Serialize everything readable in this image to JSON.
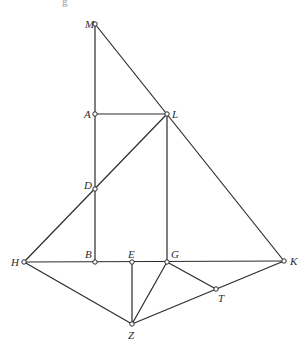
{
  "figure": {
    "type": "geometric-construction",
    "top_fragment": "g",
    "stroke_color": "#2b2b2b",
    "background": "#ffffff"
  },
  "points": [
    {
      "id": "M",
      "label": "M",
      "x": 95,
      "y": 24,
      "lx": 85,
      "ly": 28
    },
    {
      "id": "A",
      "label": "A",
      "x": 95,
      "y": 114,
      "lx": 84,
      "ly": 118
    },
    {
      "id": "L",
      "label": "L",
      "x": 167,
      "y": 114,
      "lx": 172,
      "ly": 118
    },
    {
      "id": "D",
      "label": "D",
      "x": 95,
      "y": 189,
      "lx": 84,
      "ly": 189
    },
    {
      "id": "H",
      "label": "H",
      "x": 24,
      "y": 262,
      "lx": 11,
      "ly": 266
    },
    {
      "id": "B",
      "label": "B",
      "x": 95,
      "y": 262,
      "lx": 85,
      "ly": 258
    },
    {
      "id": "E",
      "label": "E",
      "x": 132,
      "y": 262,
      "lx": 128,
      "ly": 258
    },
    {
      "id": "G",
      "label": "G",
      "x": 167,
      "y": 262,
      "lx": 171,
      "ly": 258
    },
    {
      "id": "K",
      "label": "K",
      "x": 284,
      "y": 261,
      "lx": 290,
      "ly": 265
    },
    {
      "id": "T",
      "label": "T",
      "x": 216,
      "y": 289,
      "lx": 218,
      "ly": 302
    },
    {
      "id": "Z",
      "label": "Z",
      "x": 132,
      "y": 324,
      "lx": 128,
      "ly": 339
    }
  ],
  "segments": [
    [
      "M",
      "B"
    ],
    [
      "M",
      "K"
    ],
    [
      "A",
      "L"
    ],
    [
      "H",
      "L"
    ],
    [
      "L",
      "G"
    ],
    [
      "H",
      "K"
    ],
    [
      "H",
      "Z"
    ],
    [
      "E",
      "Z"
    ],
    [
      "G",
      "Z"
    ],
    [
      "G",
      "T"
    ],
    [
      "Z",
      "K"
    ]
  ]
}
